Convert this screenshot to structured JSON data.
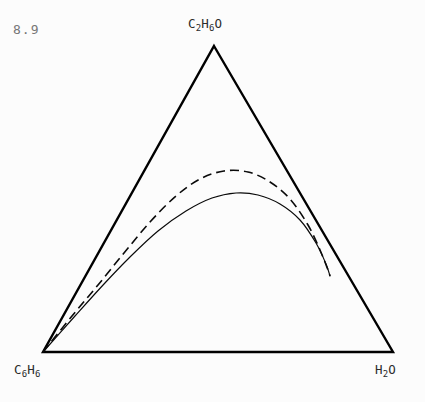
{
  "figure": {
    "number": "8.9",
    "background_color": "#fcfcfc",
    "line_color": "#000000",
    "label_color": "#2b2b2b",
    "figure_number_color": "#777777"
  },
  "vertices": {
    "apex": {
      "name": "ethanol",
      "formula_parts": [
        {
          "text": "C",
          "sub": false
        },
        {
          "text": "2",
          "sub": true
        },
        {
          "text": "H",
          "sub": false
        },
        {
          "text": "6",
          "sub": true
        },
        {
          "text": "O",
          "sub": false
        }
      ],
      "formula_plain": "C2H6O"
    },
    "bottom_left": {
      "name": "benzene",
      "formula_parts": [
        {
          "text": "C",
          "sub": false
        },
        {
          "text": "6",
          "sub": true
        },
        {
          "text": "H",
          "sub": false
        },
        {
          "text": "6",
          "sub": true
        }
      ],
      "formula_plain": "C6H6"
    },
    "bottom_right": {
      "name": "water",
      "formula_parts": [
        {
          "text": "H",
          "sub": false
        },
        {
          "text": "2",
          "sub": true
        },
        {
          "text": "O",
          "sub": false
        }
      ],
      "formula_plain": "H2O"
    }
  },
  "chart_data": {
    "type": "line",
    "title": "",
    "subtitle": "",
    "xlabel": "",
    "ylabel": "",
    "plot_style": "ternary-phase-diagram",
    "grid": false,
    "legend": "none",
    "axis_components": [
      "C6H6",
      "C2H6O",
      "H2O"
    ],
    "triangle_vertices_px": {
      "apex": [
        214,
        46
      ],
      "bottom_left": [
        43,
        352
      ],
      "bottom_right": [
        393,
        352
      ]
    },
    "series": [
      {
        "name": "binodal-curve-solid",
        "style": "solid",
        "linewidth": 1.2,
        "points_px": [
          [
            43,
            352
          ],
          [
            75,
            316
          ],
          [
            104,
            284
          ],
          [
            130,
            257
          ],
          [
            158,
            231
          ],
          [
            186,
            211
          ],
          [
            212,
            198
          ],
          [
            236,
            193
          ],
          [
            258,
            195
          ],
          [
            280,
            204
          ],
          [
            300,
            220
          ],
          [
            316,
            243
          ],
          [
            326,
            264
          ],
          [
            330,
            276
          ]
        ]
      },
      {
        "name": "tie-line-envelope-dashed",
        "style": "dashed",
        "linewidth": 1.6,
        "dash_pattern": [
          9,
          5
        ],
        "points_px": [
          [
            43,
            352
          ],
          [
            72,
            316
          ],
          [
            98,
            285
          ],
          [
            124,
            253
          ],
          [
            150,
            222
          ],
          [
            176,
            196
          ],
          [
            200,
            179
          ],
          [
            224,
            171
          ],
          [
            248,
            172
          ],
          [
            270,
            182
          ],
          [
            290,
            199
          ],
          [
            308,
            225
          ],
          [
            320,
            250
          ],
          [
            328,
            270
          ],
          [
            330,
            276
          ]
        ]
      }
    ]
  }
}
